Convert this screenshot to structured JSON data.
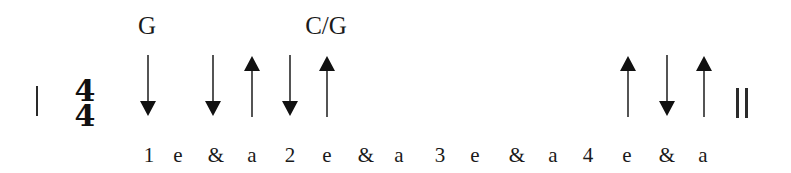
{
  "diagram": {
    "type": "strumming-pattern",
    "time_signature": {
      "top": "4",
      "bottom": "4"
    },
    "chords": [
      {
        "label": "G",
        "x": 147
      },
      {
        "label": "C/G",
        "x": 326
      }
    ],
    "counts": [
      {
        "label": "1",
        "x": 149
      },
      {
        "label": "e",
        "x": 178
      },
      {
        "label": "&",
        "x": 216
      },
      {
        "label": "a",
        "x": 252
      },
      {
        "label": "2",
        "x": 290
      },
      {
        "label": "e",
        "x": 327
      },
      {
        "label": "&",
        "x": 366
      },
      {
        "label": "a",
        "x": 399
      },
      {
        "label": "3",
        "x": 440
      },
      {
        "label": "e",
        "x": 475
      },
      {
        "label": "&",
        "x": 517
      },
      {
        "label": "a",
        "x": 553
      },
      {
        "label": "4",
        "x": 588
      },
      {
        "label": "e",
        "x": 627
      },
      {
        "label": "&",
        "x": 667
      },
      {
        "label": "a",
        "x": 703
      }
    ],
    "strums": [
      {
        "direction": "down",
        "count": "1",
        "x": 148
      },
      {
        "direction": "down",
        "count": "&",
        "x": 213
      },
      {
        "direction": "up",
        "count": "a",
        "x": 252
      },
      {
        "direction": "down",
        "count": "2",
        "x": 290
      },
      {
        "direction": "up",
        "count": "e",
        "x": 327
      },
      {
        "direction": "up",
        "count": "e",
        "x": 628
      },
      {
        "direction": "down",
        "count": "&",
        "x": 667
      },
      {
        "direction": "up",
        "count": "a",
        "x": 704
      }
    ],
    "barlines": {
      "start": "single",
      "end": "double"
    },
    "colors": {
      "ink": "#1a1a1a",
      "background": "#ffffff"
    }
  }
}
